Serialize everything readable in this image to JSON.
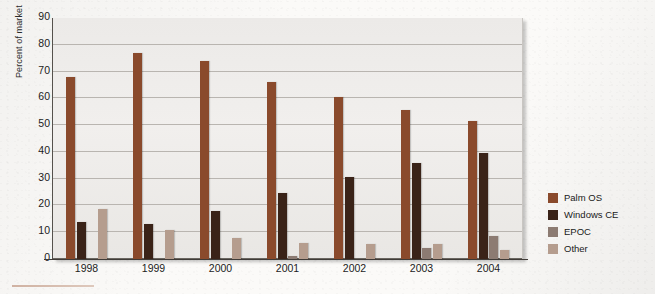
{
  "chart_data": {
    "type": "bar",
    "title": "",
    "xlabel": "",
    "ylabel": "Percent of market",
    "ylim": [
      0,
      90
    ],
    "ytick_step": 10,
    "yticks": [
      0,
      10,
      20,
      30,
      40,
      50,
      60,
      70,
      80,
      90
    ],
    "grid": true,
    "legend_position": "right",
    "categories": [
      "1998",
      "1999",
      "2000",
      "2001",
      "2002",
      "2003",
      "2004"
    ],
    "series": [
      {
        "name": "Palm OS",
        "color": "#8a4a2c",
        "values": [
          68,
          77,
          74,
          66,
          60.5,
          55.5,
          51.5
        ]
      },
      {
        "name": "Windows CE",
        "color": "#3a2318",
        "values": [
          14,
          13,
          18,
          24.5,
          30.5,
          36,
          39.5
        ]
      },
      {
        "name": "EPOC",
        "color": "#8c7b72",
        "values": [
          0,
          0,
          0,
          1,
          0,
          4,
          8.5
        ]
      },
      {
        "name": "Other",
        "color": "#b59d8e",
        "values": [
          18.5,
          11,
          8,
          6,
          5.5,
          5.5,
          3.5
        ]
      }
    ]
  },
  "axes": {
    "y_title": "Percent of market"
  }
}
